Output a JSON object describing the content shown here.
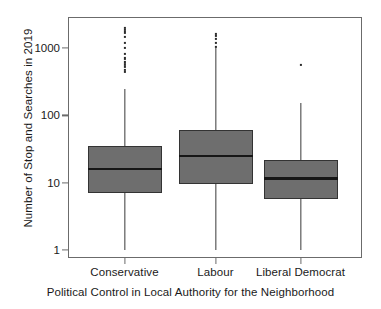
{
  "chart_data": {
    "type": "box",
    "title": "",
    "xlabel": "Political Control in Local Authority for the Neighborhood",
    "ylabel": "Number of Stop and Searches in 2019",
    "yscale": "log",
    "ylim": [
      1,
      2600
    ],
    "y_tick_labels": [
      "1000",
      "100",
      "10",
      "1"
    ],
    "y_tick_values": [
      1000,
      100,
      10,
      1
    ],
    "grid": false,
    "legend": null,
    "categories": [
      "Conservative",
      "Labour",
      "Liberal Democrat"
    ],
    "boxes": [
      {
        "name": "Conservative",
        "whisker_low": 1,
        "q1": 7,
        "median": 16,
        "q3": 35,
        "whisker_high": 250,
        "outliers": [
          440,
          470,
          520,
          560,
          610,
          700,
          820,
          1000,
          1200,
          1450,
          1700,
          1850,
          2000
        ]
      },
      {
        "name": "Labour",
        "whisker_low": 1,
        "q1": 9.5,
        "median": 25,
        "q3": 60,
        "whisker_high": 1000,
        "outliers": [
          1050,
          1200,
          1350,
          1500,
          1600
        ]
      },
      {
        "name": "Liberal Democrat",
        "whisker_low": 1,
        "q1": 5.7,
        "median": 11.5,
        "q3": 22,
        "whisker_high": 150,
        "outliers": [
          560
        ]
      }
    ]
  },
  "axis": {
    "ylabel_text": "Number of Stop and Searches in 2019",
    "xlabel_text": "Political Control in Local Authority for the Neighborhood"
  },
  "colors": {
    "box_fill": "#6e6e6e",
    "box_edge": "#333333",
    "median": "#161616",
    "whisker": "#3a3a3a",
    "outlier": "#2b2b2b",
    "frame": "#6b6b6b",
    "text": "#1a1a1a",
    "background": "#ffffff"
  }
}
